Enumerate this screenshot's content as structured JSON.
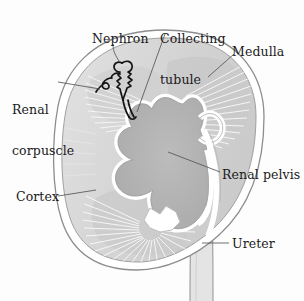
{
  "figure": {
    "background_color": "#fdfdfd"
  },
  "labels": {
    "nephron": "Nephron",
    "collecting_tubule_line1": "Collecting",
    "collecting_tubule_line2": "tubule",
    "medulla": "Medulla",
    "renal_corpuscle_line1": "Renal",
    "renal_corpuscle_line2": "corpuscle",
    "cortex": "Cortex",
    "renal_pelvis": "Renal pelvis",
    "ureter": "Ureter"
  },
  "colors": {
    "outline": "#8d8d8d",
    "capsule_fill": "#ffffff",
    "cortex_fill": "#d8d8d8",
    "medulla_fill": "#c6c6c6",
    "pelvis_fill": "#b0b0b0",
    "pelvis_outline": "#ffffff",
    "striation": "#ffffff",
    "nephron_stroke": "#141414",
    "leader_line": "#555555",
    "text": "#1a1a1a"
  },
  "structures": [
    {
      "name": "renal-capsule",
      "label": "Renal capsule (outer border)"
    },
    {
      "name": "cortex",
      "label": "Cortex"
    },
    {
      "name": "medulla",
      "label": "Medulla"
    },
    {
      "name": "renal-pelvis",
      "label": "Renal pelvis"
    },
    {
      "name": "ureter",
      "label": "Ureter"
    },
    {
      "name": "nephron",
      "label": "Nephron"
    },
    {
      "name": "renal-corpuscle",
      "label": "Renal corpuscle"
    },
    {
      "name": "collecting-tubule",
      "label": "Collecting tubule"
    }
  ]
}
